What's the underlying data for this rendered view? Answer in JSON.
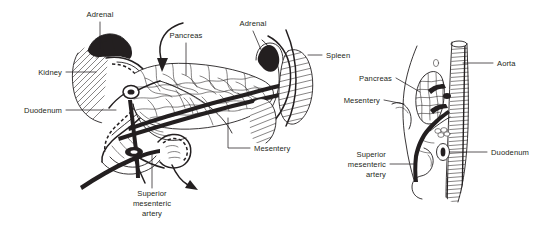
{
  "figure": {
    "style": "pen-and-ink line drawing",
    "background_color": "#ffffff",
    "ink_color": "#231f20",
    "panels": [
      {
        "id": "left-panel",
        "name": "anterior-oblique-view",
        "labels": [
          {
            "key": "adrenal_left",
            "text": "Adrenal",
            "x": 100,
            "y": 17,
            "anchor": "middle"
          },
          {
            "key": "pancreas",
            "text": "Pancreas",
            "x": 186,
            "y": 38,
            "anchor": "middle"
          },
          {
            "key": "adrenal_right",
            "text": "Adrenal",
            "x": 253,
            "y": 26,
            "anchor": "middle"
          },
          {
            "key": "kidney",
            "text": "Kidney",
            "x": 62,
            "y": 75,
            "anchor": "end"
          },
          {
            "key": "duodenum",
            "text": "Duodenum",
            "x": 62,
            "y": 113,
            "anchor": "end"
          },
          {
            "key": "mesentery",
            "text": "Mesentery",
            "x": 254,
            "y": 151,
            "anchor": "start"
          },
          {
            "key": "sma_line1",
            "text": "Superior",
            "x": 152,
            "y": 196,
            "anchor": "middle"
          },
          {
            "key": "sma_line2",
            "text": "mesenteric",
            "x": 152,
            "y": 206,
            "anchor": "middle"
          },
          {
            "key": "sma_line3",
            "text": "artery",
            "x": 152,
            "y": 216,
            "anchor": "middle"
          }
        ]
      },
      {
        "id": "right-panel",
        "name": "sagittal-cross-section-view",
        "labels": [
          {
            "key": "spleen",
            "text": "Spleen",
            "x": 326,
            "y": 58,
            "anchor": "start"
          },
          {
            "key": "pancreas",
            "text": "Pancreas",
            "x": 392,
            "y": 81,
            "anchor": "end"
          },
          {
            "key": "mesentery",
            "text": "Mesentery",
            "x": 380,
            "y": 103,
            "anchor": "end"
          },
          {
            "key": "aorta",
            "text": "Aorta",
            "x": 497,
            "y": 66,
            "anchor": "start"
          },
          {
            "key": "duodenum",
            "text": "Duodenum",
            "x": 491,
            "y": 155,
            "anchor": "start"
          },
          {
            "key": "sma_line1",
            "text": "Superior",
            "x": 386,
            "y": 157,
            "anchor": "end"
          },
          {
            "key": "sma_line2",
            "text": "mesenteric",
            "x": 386,
            "y": 167,
            "anchor": "end"
          },
          {
            "key": "sma_line3",
            "text": "artery",
            "x": 386,
            "y": 177,
            "anchor": "end"
          }
        ]
      }
    ],
    "structures": [
      {
        "name": "kidney",
        "panel": "left",
        "rendering": "hatched oval"
      },
      {
        "name": "adrenal-gland",
        "panel": "left",
        "rendering": "dark stippled cap"
      },
      {
        "name": "duodenum",
        "panel": "left",
        "rendering": "C-loop with dashed hidden outline"
      },
      {
        "name": "pancreas",
        "panel": "left",
        "rendering": "lobulated elongated body"
      },
      {
        "name": "spleen",
        "panel": "left",
        "rendering": "hatched elongated oval"
      },
      {
        "name": "superior-mesenteric-artery",
        "panel": "left",
        "rendering": "dark vessel"
      },
      {
        "name": "mesentery",
        "panel": "left",
        "rendering": "thin membrane"
      },
      {
        "name": "aorta",
        "panel": "right",
        "rendering": "vertical hatched tube"
      },
      {
        "name": "pancreas",
        "panel": "right",
        "rendering": "teardrop reticulated cross-section"
      },
      {
        "name": "duodenum",
        "panel": "right",
        "rendering": "small oval cross-section"
      },
      {
        "name": "superior-mesenteric-artery",
        "panel": "right",
        "rendering": "vessel branching from aorta"
      },
      {
        "name": "mesentery",
        "panel": "right",
        "rendering": "thin wavy membrane"
      }
    ],
    "arrows": [
      {
        "name": "pancreas-arrow",
        "panel": "left",
        "description": "curved arrow pointing down into pancreas"
      },
      {
        "name": "mesentery-arrow",
        "panel": "left",
        "description": "curved arrow sweeping right below duodenum"
      }
    ]
  }
}
